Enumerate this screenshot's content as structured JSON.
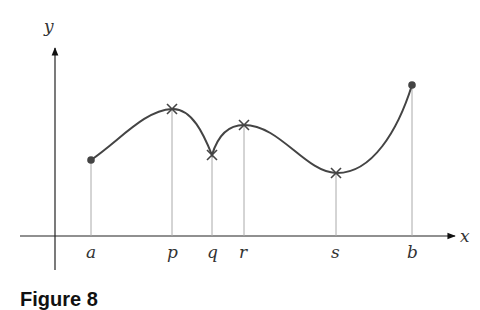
{
  "figure": {
    "caption": "Figure 8",
    "axes": {
      "x_label": "x",
      "y_label": "y"
    },
    "points": [
      {
        "label": "a",
        "marker": "dot"
      },
      {
        "label": "p",
        "marker": "cross"
      },
      {
        "label": "q",
        "marker": "cross"
      },
      {
        "label": "r",
        "marker": "cross"
      },
      {
        "label": "s",
        "marker": "cross"
      },
      {
        "label": "b",
        "marker": "dot"
      }
    ]
  },
  "colors": {
    "curve": "#444444",
    "axis": "#222222",
    "guide": "#aaaaaa"
  }
}
